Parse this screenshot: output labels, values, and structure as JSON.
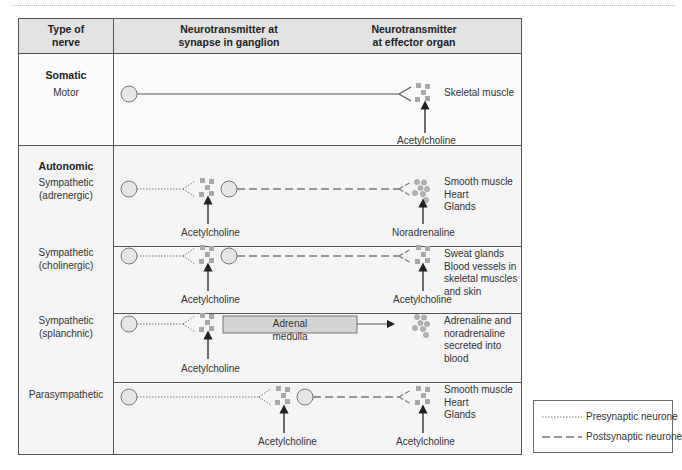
{
  "header": {
    "col1": "Type of\nnerve",
    "col2": "Neurotransmitter at\nsynapse in ganglion",
    "col3": "Neurotransmitter\nat effector organ"
  },
  "sections": {
    "somatic": {
      "title": "Somatic",
      "rows": [
        {
          "type": "Motor",
          "effector_transmitter": "Acetylcholine",
          "effector_organs": "Skeletal muscle"
        }
      ]
    },
    "autonomic": {
      "title": "Autonomic",
      "rows": [
        {
          "type": "Sympathetic\n(adrenergic)",
          "ganglion_transmitter": "Acetylcholine",
          "effector_transmitter": "Noradrenaline",
          "effector_organs": "Smooth muscle\nHeart\nGlands"
        },
        {
          "type": "Sympathetic\n(cholinergic)",
          "ganglion_transmitter": "Acetylcholine",
          "effector_transmitter": "Acetylcholine",
          "effector_organs": "Sweat glands\nBlood vessels in\nskeletal muscles\nand skin"
        },
        {
          "type": "Sympathetic\n(splanchnic)",
          "ganglion_transmitter": "Acetylcholine",
          "box_label": "Adrenal medulla",
          "effector_organs": "Adrenaline and\nnoradrenaline\nsecreted into blood"
        },
        {
          "type": "Parasympathetic",
          "ganglion_transmitter": "Acetylcholine",
          "effector_transmitter": "Acetylcholine",
          "effector_organs": "Smooth muscle\nHeart\nGlands"
        }
      ]
    }
  },
  "legend": {
    "presynaptic": "Presynaptic neurone",
    "postsynaptic": "Postsynaptic neurone"
  },
  "colors": {
    "line": "#555555",
    "cell_body_fill": "#e6e6e6",
    "vesicle": "#a8a8a8",
    "header_bg": "#e3e3e3",
    "section_bg": "#f5f5f5",
    "box_fill": "#d4d4d4"
  }
}
